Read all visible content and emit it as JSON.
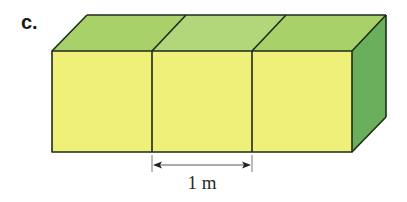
{
  "problem": {
    "label": "c."
  },
  "figure": {
    "cube_count": 3,
    "colors": {
      "front_face": "#eef07a",
      "top_face": "#a9d16a",
      "top_face_middle": "#b2d67a",
      "side_face": "#6aaf5c",
      "edge": "#1e2a1a"
    },
    "dimension": {
      "label": "1 m",
      "value": 1,
      "unit": "m"
    }
  }
}
